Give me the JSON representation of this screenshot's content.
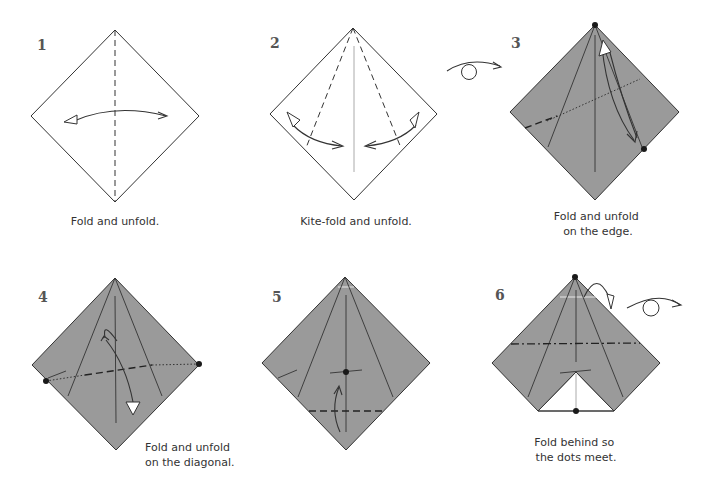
{
  "colors": {
    "background": "#ffffff",
    "paper_front": "#ffffff",
    "paper_back": "#9a9a9a",
    "line": "#333333",
    "dot": "#1a1a1a"
  },
  "steps": [
    {
      "number": "1",
      "caption_lines": [
        "Fold and unfold."
      ],
      "paper_side": "white",
      "symbols": [
        "valley-fold-line",
        "fold-unfold-arrow"
      ]
    },
    {
      "number": "2",
      "caption_lines": [
        "Kite-fold and unfold."
      ],
      "paper_side": "white",
      "symbols": [
        "valley-fold-line",
        "fold-unfold-arrow"
      ]
    },
    {
      "number": "3",
      "caption_lines": [
        "Fold and unfold",
        "on the edge."
      ],
      "paper_side": "coloured",
      "symbols": [
        "turn-over-arrow",
        "dot",
        "fold-unfold-arrow",
        "pinch-line"
      ]
    },
    {
      "number": "4",
      "caption_lines": [
        "Fold and unfold",
        "on the diagonal."
      ],
      "paper_side": "coloured",
      "symbols": [
        "dot",
        "fold-unfold-arrow",
        "pinch-line"
      ]
    },
    {
      "number": "5",
      "caption_lines": [],
      "paper_side": "coloured",
      "symbols": [
        "dot",
        "valley-fold-line",
        "fold-arrow"
      ]
    },
    {
      "number": "6",
      "caption_lines": [
        "Fold behind so",
        "the dots meet."
      ],
      "paper_side": "coloured",
      "symbols": [
        "dot",
        "mountain-fold-line",
        "fold-behind-arrow",
        "turn-over-arrow"
      ]
    }
  ]
}
